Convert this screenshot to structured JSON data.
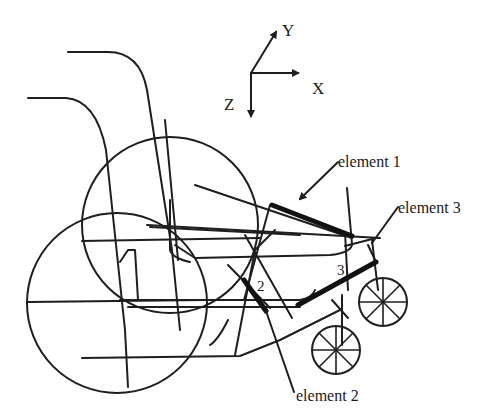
{
  "figure": {
    "type": "wheelchair-frame-model",
    "axes": {
      "x_label": "X",
      "y_label": "Y",
      "z_label": "Z"
    },
    "callouts": [
      {
        "id": "element-1",
        "label": "element 1",
        "marker": ""
      },
      {
        "id": "element-2",
        "label": "element 2",
        "marker": "2"
      },
      {
        "id": "element-3",
        "label": "element 3",
        "marker": "3"
      }
    ],
    "colors": {
      "line": "#1e1e1e",
      "background": "#ffffff"
    }
  }
}
